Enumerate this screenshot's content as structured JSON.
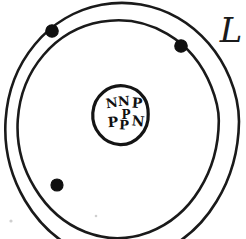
{
  "figure": {
    "background_color": "#ffffff",
    "ink_color": "#1a1a1a",
    "width": 246,
    "height": 239
  },
  "nucleus": {
    "name": "nucleus",
    "center_x": 124,
    "center_y": 115,
    "radius": 24,
    "stroke_width": 3.2,
    "particles": [
      {
        "label": "N",
        "type": "neutron",
        "x": 112,
        "y": 104,
        "size": 13,
        "rotate": -8
      },
      {
        "label": "N",
        "type": "neutron",
        "x": 124,
        "y": 102,
        "size": 13,
        "rotate": -4
      },
      {
        "label": "P",
        "type": "proton",
        "x": 137,
        "y": 104,
        "size": 14,
        "rotate": 4
      },
      {
        "label": "P",
        "type": "proton",
        "x": 126,
        "y": 115,
        "size": 12,
        "rotate": 0
      },
      {
        "label": "P",
        "type": "proton",
        "x": 113,
        "y": 123,
        "size": 14,
        "rotate": -4
      },
      {
        "label": "P",
        "type": "proton",
        "x": 124,
        "y": 126,
        "size": 13,
        "rotate": 2
      },
      {
        "label": "N",
        "type": "neutron",
        "x": 138,
        "y": 122,
        "size": 14,
        "rotate": 6
      }
    ],
    "proton_count": 4,
    "neutron_count": 3
  },
  "shells": [
    {
      "name": "outer-shell",
      "index": 2,
      "center_x": 122,
      "center_y": 120,
      "radius": 117,
      "stroke_width": 2.6
    },
    {
      "name": "inner-shell",
      "index": 1,
      "center_x": 122,
      "center_y": 120,
      "radius": 97,
      "stroke_width": 2.6
    }
  ],
  "electrons": [
    {
      "name": "electron-outer-top-left",
      "shell": "outer-shell",
      "x": 52,
      "y": 31,
      "radius": 6.2
    },
    {
      "name": "electron-inner-right",
      "shell": "inner-shell",
      "x": 181,
      "y": 46,
      "radius": 6.2
    },
    {
      "name": "electron-inner-bottom-left",
      "shell": "inner-shell",
      "x": 57,
      "y": 185,
      "radius": 6.0
    }
  ],
  "annotations": [
    {
      "name": "corner-letter",
      "text": "L",
      "x": 231,
      "y": 33,
      "size": 34,
      "note": "partially cropped at right edge"
    }
  ],
  "specks": [
    {
      "x": 11,
      "y": 221,
      "r": 1.6
    },
    {
      "x": 96,
      "y": 216,
      "r": 1.3
    }
  ]
}
